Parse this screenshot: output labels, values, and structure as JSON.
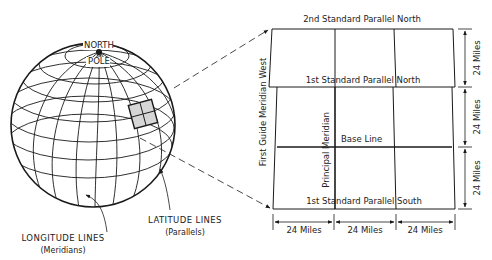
{
  "globe": {
    "pole_label_line1": "NORTH",
    "pole_label_line2": "POLE",
    "longitude_label": "LONGITUDE LINES",
    "longitude_sub": "(Meridians)",
    "latitude_label": "LATITUDE LINES",
    "latitude_sub": "(Parallels)"
  },
  "grid": {
    "top_label": "2nd Standard Parallel North",
    "middle_label": "1st Standard Parallel North",
    "base_label": "Base Line",
    "bottom_label": "1st Standard Parallel South",
    "guide_meridian_label": "First Guide Meridian West",
    "principal_meridian_label": "Principal Meridian"
  },
  "dimensions": {
    "horizontal": [
      "24 Miles",
      "24 Miles",
      "24 Miles"
    ],
    "vertical": [
      "24 Miles",
      "24 Miles",
      "24 Miles"
    ]
  },
  "colors": {
    "line": "#1a1a1a",
    "highlight_fill": "#d6d6d6"
  }
}
